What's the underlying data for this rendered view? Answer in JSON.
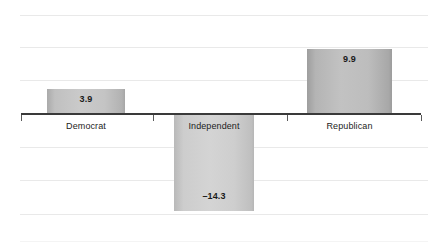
{
  "chart_data": {
    "type": "bar",
    "title": "",
    "subtitle": "",
    "xlabel": "",
    "ylabel": "",
    "categories": [
      "Democrat",
      "Independent",
      "Republican"
    ],
    "values": [
      3.9,
      -14.3,
      9.9
    ],
    "value_labels": [
      "3.9",
      "–14.3",
      "9.9"
    ],
    "ylim": [
      -19.8,
      19.8
    ],
    "grid": true,
    "gridlines_y": [
      14.85,
      9.9,
      4.95,
      -4.95,
      -9.9,
      -14.85,
      -19.8
    ],
    "legend": "none",
    "legend_position": "none",
    "baseline": 0,
    "orientation": "vertical",
    "bar_color": "#c2c2c2",
    "bar_edge_color": "#9e9e9e",
    "axis_color": "#3a3a3a",
    "grid_color": "#e9e9e9",
    "label_text_color": "#1a1a1a"
  },
  "chart": {
    "bars": [
      {
        "name": "democrat",
        "category": "Democrat",
        "value": 3.9,
        "value_label": "3.9",
        "direction": "up",
        "style": "medium",
        "left": 47,
        "width": 78,
        "top": 89,
        "height": 25,
        "label_top": 94,
        "cat_label_left": 47,
        "cat_label_width": 78,
        "cat_label_top": 121
      },
      {
        "name": "independent",
        "category": "Independent",
        "value": -14.3,
        "value_label": "–14.3",
        "direction": "down",
        "style": "light",
        "left": 174,
        "width": 80,
        "top": 115,
        "height": 96,
        "label_top": 191,
        "cat_label_left": 174,
        "cat_label_width": 80,
        "cat_label_top": 121
      },
      {
        "name": "republican",
        "category": "Republican",
        "value": 9.9,
        "value_label": "9.9",
        "direction": "up",
        "style": "",
        "left": 307,
        "width": 85,
        "top": 49,
        "height": 65,
        "label_top": 54,
        "cat_label_left": 307,
        "cat_label_width": 85,
        "cat_label_top": 121
      }
    ],
    "gridlines": [
      {
        "top": 15,
        "faint": false
      },
      {
        "top": 47,
        "faint": false
      },
      {
        "top": 80,
        "faint": false
      },
      {
        "top": 147,
        "faint": false
      },
      {
        "top": 180,
        "faint": false
      },
      {
        "top": 214,
        "faint": false
      },
      {
        "top": 241,
        "faint": true
      }
    ],
    "ticks": [
      21,
      153,
      287,
      421
    ]
  }
}
